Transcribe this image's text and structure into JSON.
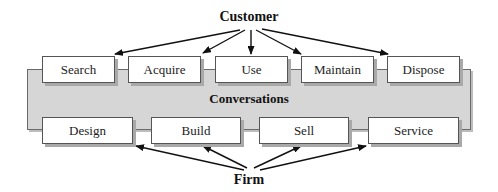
{
  "diagram": {
    "top_label": "Customer",
    "middle_label": "Conversations",
    "bottom_label": "Firm",
    "customer_activities": [
      {
        "label": "Search"
      },
      {
        "label": "Acquire"
      },
      {
        "label": "Use"
      },
      {
        "label": "Maintain"
      },
      {
        "label": "Dispose"
      }
    ],
    "firm_activities": [
      {
        "label": "Design"
      },
      {
        "label": "Build"
      },
      {
        "label": "Sell"
      },
      {
        "label": "Service"
      }
    ],
    "colors": {
      "band_fill": "#d6d6d6",
      "box_fill": "#ffffff",
      "stroke": "#111111"
    }
  }
}
